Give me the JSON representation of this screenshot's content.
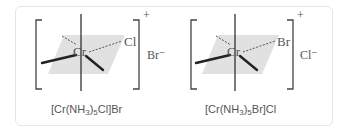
{
  "structures": [
    {
      "central_atom": "Cr",
      "labeled_ligand": "Cl",
      "complex_charge": "+",
      "counter_ion": "Br⁻",
      "formula": {
        "prefix": "[Cr(NH",
        "sub1": "3",
        "mid": ")",
        "sub2": "5",
        "suffix": "Cl]Br"
      }
    },
    {
      "central_atom": "Cr",
      "labeled_ligand": "Br",
      "complex_charge": "+",
      "counter_ion": "Cl⁻",
      "formula": {
        "prefix": "[Cr(NH",
        "sub1": "3",
        "mid": ")",
        "sub2": "5",
        "suffix": "Br]Cl"
      }
    }
  ],
  "colors": {
    "plane": "#dcdcdc",
    "bond": "#222222",
    "bracket": "#444444",
    "text": "#555555",
    "border": "#e6e6e6"
  }
}
